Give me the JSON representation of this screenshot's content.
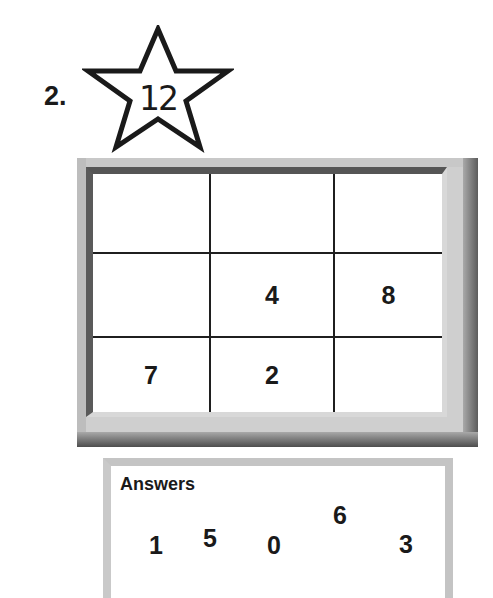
{
  "problem": {
    "number_label": "2.",
    "target_label": "12",
    "target_shape": "star-icon"
  },
  "grid": {
    "rows": 3,
    "cols": 3,
    "cells": [
      [
        "",
        "",
        ""
      ],
      [
        "",
        "4",
        "8"
      ],
      [
        "7",
        "2",
        ""
      ]
    ]
  },
  "answers": {
    "title": "Answers",
    "values": [
      "1",
      "5",
      "0",
      "6",
      "3"
    ]
  },
  "colors": {
    "ink": "#1a1a1a",
    "frame_light": "#c8c8c8",
    "frame_dark": "#555555",
    "answers_border": "#c4c4c4",
    "background": "#ffffff"
  }
}
